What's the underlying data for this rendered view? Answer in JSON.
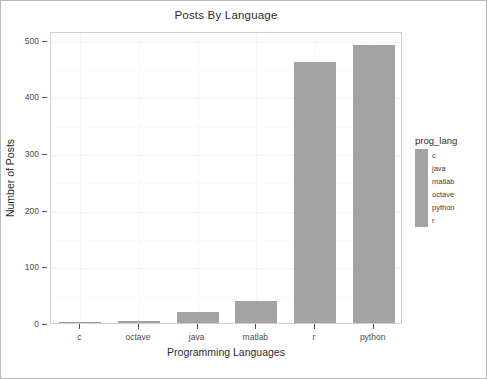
{
  "chart_data": {
    "type": "bar",
    "title": "Posts By Language",
    "xlabel": "Programming Languages",
    "ylabel": "Number of Posts",
    "categories": [
      "c",
      "octave",
      "java",
      "matlab",
      "r",
      "python"
    ],
    "values": [
      2,
      4,
      20,
      39,
      460,
      490
    ],
    "ylim": [
      0,
      515
    ],
    "yticks": [
      0,
      100,
      200,
      300,
      400,
      500
    ],
    "ytick_labels": [
      "0",
      "100",
      "200",
      "300",
      "400",
      "500"
    ],
    "grid": true,
    "legend_position": "right",
    "bar_color": "#a3a3a3",
    "panel_background": "#ffffff",
    "legend": {
      "title": "prog_lang",
      "entries": [
        {
          "label": "c",
          "color": "#a3a3a3"
        },
        {
          "label": "java",
          "color": "#a3a3a3"
        },
        {
          "label": "matlab",
          "color": "#a3a3a3"
        },
        {
          "label": "octave",
          "color": "#a3a3a3"
        },
        {
          "label": "python",
          "color": "#a3a3a3"
        },
        {
          "label": "r",
          "color": "#a3a3a3"
        }
      ]
    }
  }
}
